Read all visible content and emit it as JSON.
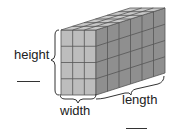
{
  "figure": {
    "type": "rectangular-prism-of-unit-cubes",
    "dimensions_in_cubes": {
      "width": 3,
      "height": 4,
      "length": 6
    },
    "colors": {
      "front_face": "#bdbdbd",
      "side_face": "#8f8f8f",
      "top_face": "#c9c9c9",
      "grid_line": "#555555",
      "bracket": "#333333"
    }
  },
  "labels": {
    "height": "height",
    "width": "width",
    "length": "length"
  },
  "answer_blanks": [
    {
      "for": "height",
      "value": ""
    },
    {
      "for": "length",
      "value": ""
    }
  ]
}
